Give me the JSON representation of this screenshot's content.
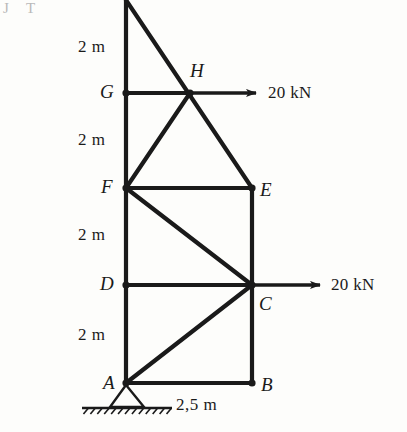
{
  "figure": {
    "ink_color": "#1a1a1a",
    "background_color": "#fdfdfb"
  },
  "nodes": [
    {
      "id": "A",
      "label": "A",
      "x": 126,
      "y": 383,
      "label_x": 103,
      "label_y": 373
    },
    {
      "id": "B",
      "label": "B",
      "x": 252,
      "y": 383,
      "label_x": 261,
      "label_y": 375
    },
    {
      "id": "C",
      "label": "C",
      "x": 252,
      "y": 285,
      "label_x": 259,
      "label_y": 294
    },
    {
      "id": "D",
      "label": "D",
      "x": 126,
      "y": 285,
      "label_x": 100,
      "label_y": 274
    },
    {
      "id": "E",
      "label": "E",
      "x": 252,
      "y": 188,
      "label_x": 260,
      "label_y": 180
    },
    {
      "id": "F",
      "label": "F",
      "x": 126,
      "y": 188,
      "label_x": 101,
      "label_y": 177
    },
    {
      "id": "G",
      "label": "G",
      "x": 126,
      "y": 93,
      "label_x": 100,
      "label_y": 82
    },
    {
      "id": "H",
      "label": "H",
      "x": 190,
      "y": 93,
      "label_x": 190,
      "label_y": 61
    },
    {
      "id": "TOP",
      "label": "",
      "x": 126,
      "y": 0,
      "label_x": 0,
      "label_y": 0
    }
  ],
  "members": [
    {
      "name": "column-top-G",
      "from": "TOP",
      "to": "G"
    },
    {
      "name": "column-G-F",
      "from": "G",
      "to": "F"
    },
    {
      "name": "column-F-D",
      "from": "F",
      "to": "D"
    },
    {
      "name": "column-D-A",
      "from": "D",
      "to": "A"
    },
    {
      "name": "chord-G-H",
      "from": "G",
      "to": "H"
    },
    {
      "name": "chord-F-E",
      "from": "F",
      "to": "E"
    },
    {
      "name": "chord-D-C",
      "from": "D",
      "to": "C"
    },
    {
      "name": "chord-A-B",
      "from": "A",
      "to": "B"
    },
    {
      "name": "column-E-C",
      "from": "E",
      "to": "C"
    },
    {
      "name": "column-C-B",
      "from": "C",
      "to": "B"
    },
    {
      "name": "diagonal-top-E",
      "from": "TOP",
      "to": "E"
    },
    {
      "name": "diagonal-F-H",
      "from": "F",
      "to": "H"
    },
    {
      "name": "diagonal-F-C",
      "from": "F",
      "to": "C"
    },
    {
      "name": "diagonal-A-C",
      "from": "A",
      "to": "C"
    }
  ],
  "loads": [
    {
      "name": "load-at-H",
      "value_text": "20 kN",
      "magnitude": 20,
      "unit": "kN",
      "direction": "right",
      "applied_at": "H",
      "arrow_x1": 190,
      "arrow_y1": 93,
      "arrow_x2": 256,
      "arrow_y2": 93,
      "label_x": 268,
      "label_y": 84
    },
    {
      "name": "load-at-C",
      "value_text": "20 kN",
      "magnitude": 20,
      "unit": "kN",
      "direction": "right",
      "applied_at": "C",
      "arrow_x1": 252,
      "arrow_y1": 285,
      "arrow_x2": 320,
      "arrow_y2": 285,
      "label_x": 331,
      "label_y": 276
    }
  ],
  "dimensions": [
    {
      "name": "dim-top-to-G",
      "text": "2 m",
      "x": 78,
      "y": 38
    },
    {
      "name": "dim-G-to-F",
      "text": "2 m",
      "x": 78,
      "y": 131
    },
    {
      "name": "dim-F-to-D",
      "text": "2 m",
      "x": 78,
      "y": 226
    },
    {
      "name": "dim-D-to-A",
      "text": "2 m",
      "x": 78,
      "y": 326
    },
    {
      "name": "dim-span-A-B",
      "text": "2,5 m",
      "x": 176,
      "y": 396
    }
  ],
  "support": {
    "name": "pin-support-at-A",
    "type": "pinned",
    "apex_x": 126,
    "apex_y": 385,
    "base_left_x": 110,
    "base_right_x": 144,
    "base_y": 407,
    "ground_x1": 82,
    "ground_x2": 172,
    "ground_y": 408,
    "hatch_count": 13
  },
  "artifacts": [
    {
      "name": "scan-smudge-left",
      "text": "J",
      "x": 3,
      "y": 0
    },
    {
      "name": "scan-smudge-right",
      "text": "T",
      "x": 26,
      "y": 0
    }
  ]
}
